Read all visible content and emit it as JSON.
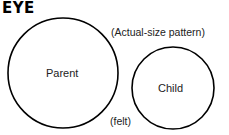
{
  "title": "EYE",
  "note": "(Actual-size pattern)",
  "material": "(felt)",
  "shapes": {
    "parent": {
      "label": "Parent",
      "cx": 63,
      "cy": 73,
      "r": 55
    },
    "child": {
      "label": "Child",
      "cx": 173,
      "cy": 88,
      "r": 41
    }
  },
  "stroke_color": "#000000"
}
